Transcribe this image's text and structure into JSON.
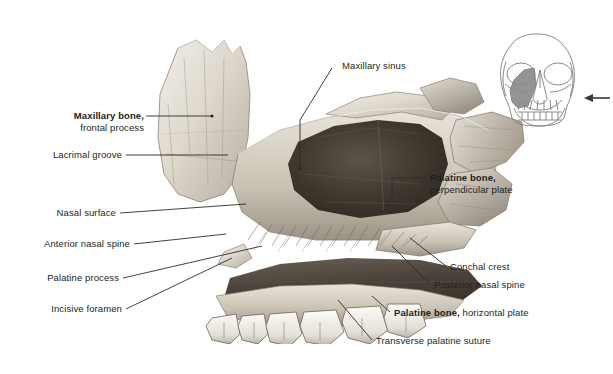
{
  "figure": {
    "background_color": "#ffffff",
    "label_color": "#231f20",
    "leader_color": "#2b2b2b"
  },
  "labels": {
    "maxillary_sinus": {
      "line1": "Maxillary sinus",
      "line2": ""
    },
    "maxillary_bone": {
      "line1": "Maxillary bone,",
      "line2": "frontal process"
    },
    "lacrimal_groove": {
      "line1": "Lacrimal groove",
      "line2": ""
    },
    "nasal_surface": {
      "line1": "Nasal surface",
      "line2": ""
    },
    "anterior_nasal_spine": {
      "line1": "Anterior nasal spine",
      "line2": ""
    },
    "palatine_process": {
      "line1": "Palatine process",
      "line2": ""
    },
    "incisive_foramen": {
      "line1": "Incisive foramen",
      "line2": ""
    },
    "palatine_bone_perpendicular": {
      "line1": "Palatine bone,",
      "line2": "perpendicular plate"
    },
    "conchal_crest": {
      "line1": "Conchal crest",
      "line2": ""
    },
    "posterior_nasal_spine": {
      "line1": "Posterior nasal spine",
      "line2": ""
    },
    "palatine_bone_horizontal": {
      "line1": "Palatine bone,",
      "line2": " horizontal plate"
    },
    "transverse_palatine_suture": {
      "line1": "Transverse palatine suture",
      "line2": ""
    }
  },
  "inset": {
    "name": "anterior-skull-orientation-diagram",
    "highlight_color": "#8c8c8c",
    "outline_color": "#7d7d7d",
    "arrow_direction": "left",
    "arrow_color": "#3a3a3a"
  },
  "specimen": {
    "name": "maxilla-palatine-bone-photograph",
    "sinus_cavity": "maxillary sinus",
    "bone_light": "#e8e4dd",
    "bone_mid": "#c3bcb1",
    "bone_dark": "#6e6individual",
    "teeth_color": "#f3f1ec"
  }
}
